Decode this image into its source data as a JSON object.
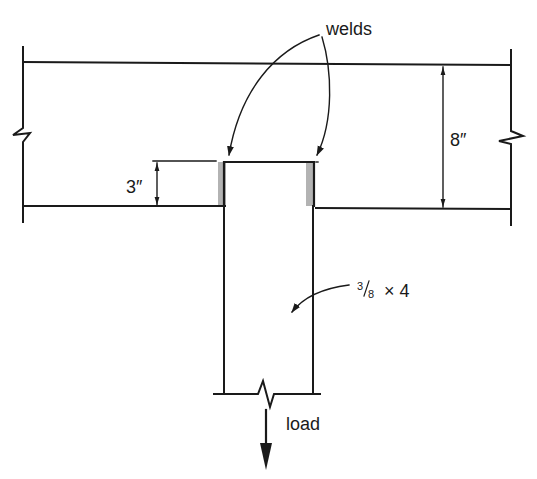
{
  "diagram": {
    "type": "welded-plate-connection",
    "colors": {
      "line": "#1a1a1a",
      "weld": "#b3b3b3",
      "background": "#ffffff"
    },
    "labels": {
      "welds": "welds",
      "beam_depth": "8″",
      "weld_length": "3″",
      "plate_size_numerator": "3",
      "plate_size_denominator": "8",
      "plate_size_rest": "× 4",
      "load": "load"
    }
  }
}
